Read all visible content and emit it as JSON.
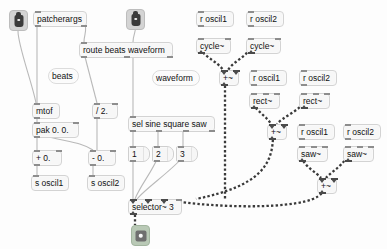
{
  "patcher": {
    "title": "Max/MSP subpatcher",
    "background_color": "#fdfdfd",
    "width": 387,
    "height": 249,
    "signal_cord_color": "#3a3a3a",
    "control_cord_color": "#b9b9b9"
  },
  "ports": [
    {
      "name": "inlet-left",
      "kind": "inlet",
      "x": 9,
      "y": 10
    },
    {
      "name": "inlet-middle",
      "kind": "inlet",
      "x": 126,
      "y": 9
    },
    {
      "name": "outlet-audio",
      "kind": "outlet",
      "x": 131,
      "y": 225
    }
  ],
  "objects": [
    {
      "id": "patcherargs",
      "text": "patcherargs",
      "x": 33,
      "y": 11,
      "w": 54,
      "kind": "object",
      "inlets": 1,
      "outlets": 2,
      "signal_in": 0,
      "signal_out": 0
    },
    {
      "id": "route",
      "text": "route beats waveform",
      "x": 79,
      "y": 42,
      "w": 94,
      "kind": "object",
      "inlets": 1,
      "outlets": 3,
      "signal_in": 0,
      "signal_out": 0
    },
    {
      "id": "beats",
      "text": "beats",
      "x": 48,
      "y": 68,
      "w": 31,
      "kind": "comment"
    },
    {
      "id": "waveform",
      "text": "waveform",
      "x": 152,
      "y": 70,
      "w": 48,
      "kind": "comment"
    },
    {
      "id": "mtof",
      "text": "mtof",
      "x": 32,
      "y": 103,
      "w": 28,
      "kind": "object",
      "inlets": 1,
      "outlets": 1
    },
    {
      "id": "div2",
      "text": "/ 2.",
      "x": 92,
      "y": 103,
      "w": 26,
      "kind": "object",
      "inlets": 2,
      "outlets": 1
    },
    {
      "id": "pak",
      "text": "pak 0. 0.",
      "x": 32,
      "y": 122,
      "w": 47,
      "kind": "object",
      "inlets": 2,
      "outlets": 1
    },
    {
      "id": "plus0",
      "text": "+ 0.",
      "x": 32,
      "y": 150,
      "w": 30,
      "kind": "object",
      "inlets": 2,
      "outlets": 1
    },
    {
      "id": "minus0",
      "text": "- 0.",
      "x": 88,
      "y": 150,
      "w": 28,
      "kind": "object",
      "inlets": 2,
      "outlets": 1
    },
    {
      "id": "soscil1",
      "text": "s oscil1",
      "x": 31,
      "y": 175,
      "w": 38,
      "kind": "object",
      "inlets": 1,
      "outlets": 0
    },
    {
      "id": "soscil2",
      "text": "s oscil2",
      "x": 87,
      "y": 175,
      "w": 38,
      "kind": "object",
      "inlets": 1,
      "outlets": 0
    },
    {
      "id": "sel",
      "text": "sel sine square saw",
      "x": 128,
      "y": 116,
      "w": 87,
      "kind": "object",
      "inlets": 1,
      "outlets": 4
    },
    {
      "id": "msg1",
      "text": "1",
      "x": 128,
      "y": 146,
      "w": 22,
      "kind": "message",
      "inlets": 1,
      "outlets": 1
    },
    {
      "id": "msg2",
      "text": "2",
      "x": 152,
      "y": 146,
      "w": 22,
      "kind": "message",
      "inlets": 1,
      "outlets": 1
    },
    {
      "id": "msg3",
      "text": "3",
      "x": 176,
      "y": 146,
      "w": 22,
      "kind": "message",
      "inlets": 1,
      "outlets": 1
    },
    {
      "id": "selector",
      "text": "selector~ 3",
      "x": 128,
      "y": 199,
      "w": 54,
      "kind": "object",
      "inlets": 4,
      "outlets": 1,
      "signal_in": 3,
      "signal_out": 1
    },
    {
      "id": "roscil1a",
      "text": "r oscil1",
      "x": 196,
      "y": 11,
      "w": 38,
      "kind": "object",
      "inlets": 1,
      "outlets": 1
    },
    {
      "id": "roscil2a",
      "text": "r oscil2",
      "x": 246,
      "y": 11,
      "w": 38,
      "kind": "object",
      "inlets": 1,
      "outlets": 1
    },
    {
      "id": "cycle1",
      "text": "cycle~",
      "x": 196,
      "y": 38,
      "w": 35,
      "kind": "object",
      "inlets": 2,
      "outlets": 1,
      "signal_out": 1
    },
    {
      "id": "cycle2",
      "text": "cycle~",
      "x": 246,
      "y": 38,
      "w": 35,
      "kind": "object",
      "inlets": 2,
      "outlets": 1,
      "signal_out": 1
    },
    {
      "id": "plusA",
      "text": "+~",
      "x": 219,
      "y": 70,
      "w": 20,
      "kind": "object",
      "inlets": 2,
      "outlets": 1,
      "signal_in": 2,
      "signal_out": 1
    },
    {
      "id": "roscil1b",
      "text": "r oscil1",
      "x": 249,
      "y": 70,
      "w": 38,
      "kind": "object",
      "inlets": 1,
      "outlets": 1
    },
    {
      "id": "roscil2b",
      "text": "r oscil2",
      "x": 299,
      "y": 70,
      "w": 38,
      "kind": "object",
      "inlets": 1,
      "outlets": 1
    },
    {
      "id": "rect1",
      "text": "rect~",
      "x": 249,
      "y": 93,
      "w": 31,
      "kind": "object",
      "inlets": 3,
      "outlets": 1,
      "signal_out": 1
    },
    {
      "id": "rect2",
      "text": "rect~",
      "x": 299,
      "y": 93,
      "w": 31,
      "kind": "object",
      "inlets": 3,
      "outlets": 1,
      "signal_out": 1
    },
    {
      "id": "plusB",
      "text": "+~",
      "x": 267,
      "y": 124,
      "w": 20,
      "kind": "object",
      "inlets": 2,
      "outlets": 1,
      "signal_in": 2,
      "signal_out": 1
    },
    {
      "id": "roscil1c",
      "text": "r oscil1",
      "x": 297,
      "y": 124,
      "w": 38,
      "kind": "object",
      "inlets": 1,
      "outlets": 1
    },
    {
      "id": "roscil2c",
      "text": "r oscil2",
      "x": 343,
      "y": 124,
      "w": 38,
      "kind": "object",
      "inlets": 1,
      "outlets": 1
    },
    {
      "id": "saw1",
      "text": "saw~",
      "x": 297,
      "y": 146,
      "w": 31,
      "kind": "object",
      "inlets": 3,
      "outlets": 1,
      "signal_out": 1
    },
    {
      "id": "saw2",
      "text": "saw~",
      "x": 343,
      "y": 146,
      "w": 31,
      "kind": "object",
      "inlets": 3,
      "outlets": 1,
      "signal_out": 1
    },
    {
      "id": "plusC",
      "text": "+~",
      "x": 317,
      "y": 178,
      "w": 20,
      "kind": "object",
      "inlets": 2,
      "outlets": 1,
      "signal_in": 2,
      "signal_out": 1
    }
  ],
  "cords": {
    "control": [
      "M18,31 C18,46 32,82 36,103",
      "M37,22 L37,103",
      "M84,22 C88,30 84,34 84,42",
      "M84,53 L97,103",
      "M37,114 L37,122",
      "M97,114 L97,150",
      "M37,133 L37,150",
      "M37,133 C60,142 78,140 93,150",
      "M37,161 L37,175",
      "M93,161 L93,175",
      "M136,22 C137,30 133,34 133,42",
      "M133,53 L133,116",
      "M133,127 L133,146",
      "M158,127 L158,146",
      "M183,127 L183,146",
      "M133,157 L133,199",
      "M158,157 C152,172 140,186 135,199",
      "M183,157 C170,172 146,188 137,199"
    ],
    "signal": [
      "M200,49 C206,58 218,62 223,70",
      "M250,49 C244,58 233,62 228,70",
      "M225,81 L225,199",
      "M253,104 C258,112 267,117 271,124",
      "M303,104 C296,112 283,117 277,124",
      "M273,135 C273,165 260,186 196,199",
      "M301,157 C306,168 316,172 321,178",
      "M347,157 C340,168 331,172 326,178",
      "M323,189 C323,212 210,208 168,200",
      "M135,210 L135,225"
    ]
  }
}
